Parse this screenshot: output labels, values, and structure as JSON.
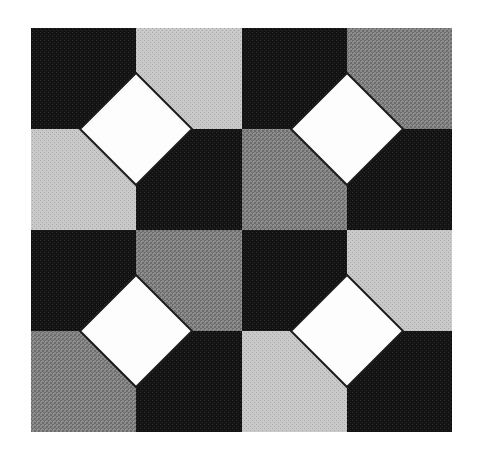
{
  "image": {
    "title": "Geometric Tiling Pattern",
    "description": "Black and white halftone quilt block: a four-by-four checkerboard of squares in dark, light gray and medium gray, with four white diamonds (squares rotated forty-five degrees) centred on the interior grid intersections.",
    "width": 477,
    "height": 455,
    "background": "#ffffff"
  },
  "palette": {
    "dark": "#1c1c1c",
    "light_gray": "#bdbdbd",
    "medium_gray": "#7e7e7e",
    "white": "#ffffff",
    "outline": "#1c1c1c",
    "background": "#ffffff"
  },
  "pattern": {
    "type": "checkerboard-with-diamonds",
    "frame": {
      "x": 31,
      "y": 28,
      "width": 421,
      "height": 404
    },
    "grid": {
      "columns": 4,
      "rows": 4,
      "column_edges": [
        31,
        136,
        242,
        347,
        452
      ],
      "row_edges": [
        28,
        129,
        230,
        331,
        432
      ],
      "cell_width": 105.25,
      "cell_height": 101
    },
    "cells": [
      [
        {
          "row": 0,
          "col": 0,
          "fill": "dark"
        },
        {
          "row": 0,
          "col": 1,
          "fill": "light_gray"
        },
        {
          "row": 0,
          "col": 2,
          "fill": "dark"
        },
        {
          "row": 0,
          "col": 3,
          "fill": "medium_gray"
        }
      ],
      [
        {
          "row": 1,
          "col": 0,
          "fill": "light_gray"
        },
        {
          "row": 1,
          "col": 1,
          "fill": "dark"
        },
        {
          "row": 1,
          "col": 2,
          "fill": "medium_gray"
        },
        {
          "row": 1,
          "col": 3,
          "fill": "dark"
        }
      ],
      [
        {
          "row": 2,
          "col": 0,
          "fill": "dark"
        },
        {
          "row": 2,
          "col": 1,
          "fill": "medium_gray"
        },
        {
          "row": 2,
          "col": 2,
          "fill": "dark"
        },
        {
          "row": 2,
          "col": 3,
          "fill": "light_gray"
        }
      ],
      [
        {
          "row": 3,
          "col": 0,
          "fill": "medium_gray"
        },
        {
          "row": 3,
          "col": 1,
          "fill": "dark"
        },
        {
          "row": 3,
          "col": 2,
          "fill": "light_gray"
        },
        {
          "row": 3,
          "col": 3,
          "fill": "dark"
        }
      ]
    ],
    "diamonds": [
      {
        "name": "diamond-top-left",
        "cx": 136,
        "cy": 129,
        "radius": 56,
        "fill": "white",
        "stroke": "outline",
        "stroke_width": 2
      },
      {
        "name": "diamond-top-right",
        "cx": 347,
        "cy": 129,
        "radius": 56,
        "fill": "white",
        "stroke": "outline",
        "stroke_width": 2
      },
      {
        "name": "diamond-bottom-left",
        "cx": 136,
        "cy": 331,
        "radius": 56,
        "fill": "white",
        "stroke": "outline",
        "stroke_width": 2
      },
      {
        "name": "diamond-bottom-right",
        "cx": 347,
        "cy": 331,
        "radius": 56,
        "fill": "white",
        "stroke": "outline",
        "stroke_width": 2
      }
    ]
  }
}
